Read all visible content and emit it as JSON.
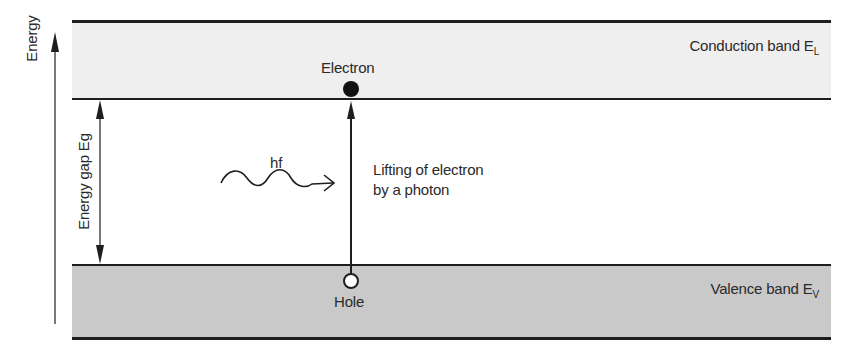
{
  "diagram": {
    "axis": {
      "label": "Energy"
    },
    "energy_gap": {
      "label": "Energy gap Eg"
    },
    "conduction_band": {
      "label": "Conduction band E",
      "subscript": "L",
      "fill": "#efefef"
    },
    "valence_band": {
      "label": "Valence band E",
      "subscript": "V",
      "fill": "#c9c9c9"
    },
    "electron": {
      "label": "Electron"
    },
    "hole": {
      "label": "Hole"
    },
    "photon": {
      "label": "hf"
    },
    "transition": {
      "line1": "Lifting of electron",
      "line2": "by a photon"
    },
    "line_color": "#1e1e1e"
  }
}
